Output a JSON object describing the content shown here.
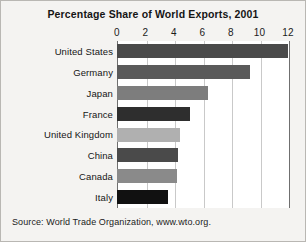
{
  "chart_data": {
    "type": "bar",
    "orientation": "horizontal",
    "title": "Percentage Share of World Exports, 2001",
    "xlabel": "",
    "ylabel": "",
    "xlim": [
      0,
      12
    ],
    "xticks": [
      0,
      2,
      4,
      6,
      8,
      10,
      12
    ],
    "xtick_labels": [
      "0",
      "2",
      "4",
      "6",
      "8",
      "10",
      "12"
    ],
    "grid": true,
    "grid_axis": "x",
    "legend": false,
    "categories": [
      "United States",
      "Germany",
      "Japan",
      "France",
      "United Kingdom",
      "China",
      "Canada",
      "Italy"
    ],
    "values": [
      12.0,
      9.3,
      6.4,
      5.1,
      4.4,
      4.3,
      4.2,
      3.6
    ],
    "bar_colors": [
      "#4a4a4a",
      "#5a5a5a",
      "#7d7d7d",
      "#2e2e2e",
      "#b0b0b0",
      "#4a4a4a",
      "#8a8a8a",
      "#111111"
    ],
    "source": "Source: World Trade Organization, www.wto.org."
  },
  "figure": {
    "background": "#f4f3f1",
    "border_color": "#b9b7b3",
    "plot_background": "#ffffff",
    "axis_color": "#6f6f6f",
    "gridline_color": "#c9c9c9"
  }
}
